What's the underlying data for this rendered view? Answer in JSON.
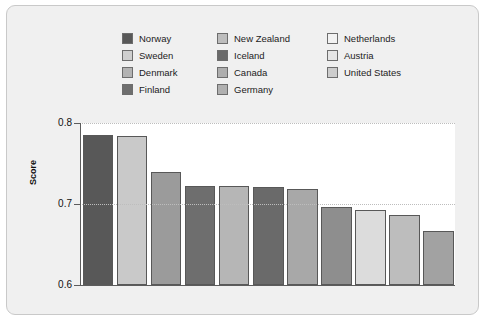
{
  "chart_data": {
    "type": "bar",
    "title": "",
    "xlabel": "",
    "ylabel": "Score",
    "ylim": [
      0.6,
      0.8
    ],
    "yticks": [
      "0.6",
      "0.7",
      "0.8"
    ],
    "grid": true,
    "legend_position": "top",
    "categories": [
      "Norway",
      "Sweden",
      "Denmark",
      "Finland",
      "New Zealand",
      "Iceland",
      "Canada",
      "Germany",
      "Netherlands",
      "Austria",
      "United States"
    ],
    "values": [
      0.785,
      0.784,
      0.74,
      0.722,
      0.722,
      0.721,
      0.718,
      0.696,
      0.692,
      0.686,
      0.667
    ],
    "colors": [
      "#585858",
      "#c9c9c9",
      "#9b9b9b",
      "#6e6e6e",
      "#b6b6b6",
      "#6a6a6a",
      "#a8a8a8",
      "#8e8e8e",
      "#dcdcdc",
      "#bdbdbd",
      "#a2a2a2"
    ],
    "series": [
      {
        "name": "Score",
        "values": [
          0.785,
          0.784,
          0.74,
          0.722,
          0.722,
          0.721,
          0.718,
          0.696,
          0.692,
          0.686,
          0.667
        ]
      }
    ]
  },
  "legend": {
    "columns": [
      [
        {
          "label": "Norway",
          "color": "#585858"
        },
        {
          "label": "Sweden",
          "color": "#cfcfcf"
        },
        {
          "label": "Denmark",
          "color": "#b3b3b3"
        },
        {
          "label": "Finland",
          "color": "#6e6e6e"
        }
      ],
      [
        {
          "label": "New Zealand",
          "color": "#bdbdbd"
        },
        {
          "label": "Iceland",
          "color": "#6a6a6a"
        },
        {
          "label": "Canada",
          "color": "#aeaeae"
        },
        {
          "label": "Germany",
          "color": "#b0b0b0"
        }
      ],
      [
        {
          "label": "Netherlands",
          "color": "#f2f2f2"
        },
        {
          "label": "Austria",
          "color": "#e6e6e6"
        },
        {
          "label": "United States",
          "color": "#cdcdcd"
        }
      ]
    ]
  },
  "axis": {
    "y_title": "Score",
    "ticks": [
      {
        "value": "0.8",
        "pos": 0.8
      },
      {
        "value": "0.7",
        "pos": 0.7
      },
      {
        "value": "0.6",
        "pos": 0.6
      }
    ]
  }
}
